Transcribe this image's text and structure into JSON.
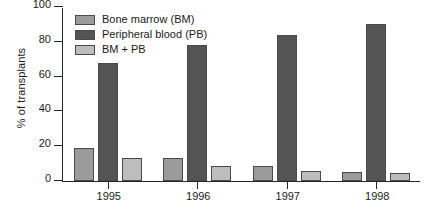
{
  "chart_data": {
    "type": "bar",
    "title": "",
    "xlabel": "",
    "ylabel": "% of transplants",
    "categories": [
      "1995",
      "1996",
      "1997",
      "1998"
    ],
    "ylim": [
      0,
      100
    ],
    "yticks": [
      0,
      20,
      40,
      60,
      80,
      100
    ],
    "grid": false,
    "legend_position": "top-left inside axes",
    "series": [
      {
        "name": "Bone marrow (BM)",
        "color": "#9b9b9b",
        "values": [
          19,
          13,
          8.5,
          5
        ]
      },
      {
        "name": "Peripheral blood (PB)",
        "color": "#545454",
        "values": [
          68,
          78,
          84,
          90
        ]
      },
      {
        "name": "BM + PB",
        "color": "#bdbdbd",
        "values": [
          13,
          8.5,
          6,
          4.5
        ]
      }
    ]
  },
  "axes": {
    "tick_labels_y": [
      "0",
      "20",
      "40",
      "60",
      "80",
      "100"
    ],
    "tick_labels_x": [
      "1995",
      "1996",
      "1997",
      "1998"
    ]
  },
  "style": {
    "axis_color": "#262626",
    "bar_edge_color": "#4a4a4a",
    "background": "#ffffff"
  }
}
